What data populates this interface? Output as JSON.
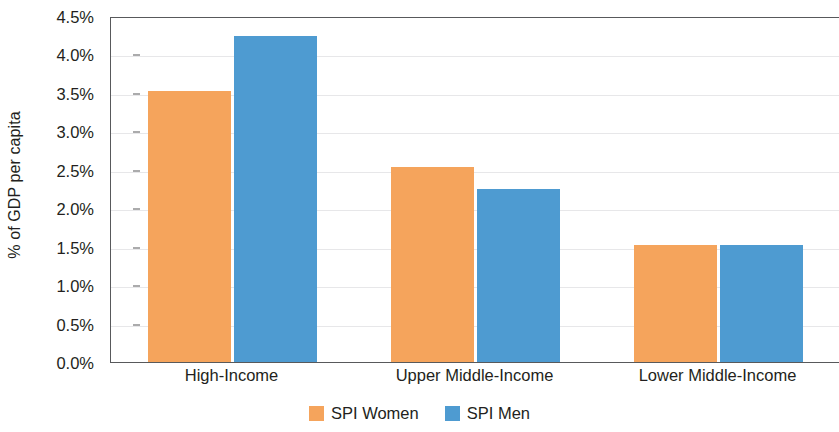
{
  "chart_data": {
    "type": "bar",
    "title": "",
    "subtitle": "",
    "xlabel": "",
    "ylabel": "% of GDP per capita",
    "categories": [
      "High-Income",
      "Upper Middle-Income",
      "Lower Middle-Income"
    ],
    "series": [
      {
        "name": "SPI Women",
        "color": "#f5a45c",
        "values": [
          3.52,
          2.53,
          1.52
        ]
      },
      {
        "name": "SPI Men",
        "color": "#4e9bd1",
        "values": [
          4.24,
          2.25,
          1.52
        ]
      }
    ],
    "ylim": [
      0,
      4.5
    ],
    "ytick_values": [
      0.0,
      0.5,
      1.0,
      1.5,
      2.0,
      2.5,
      3.0,
      3.5,
      4.0,
      4.5
    ],
    "ytick_labels": [
      "0.0%",
      "0.5%",
      "1.0%",
      "1.5%",
      "2.0%",
      "2.5%",
      "3.0%",
      "3.5%",
      "4.0%",
      "4.5%"
    ],
    "grid": true,
    "legend_position": "bottom",
    "legend": [
      "SPI Women",
      "SPI Men"
    ]
  }
}
